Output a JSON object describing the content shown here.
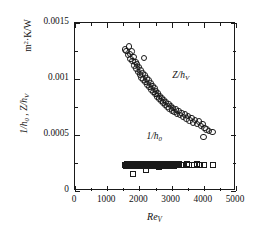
{
  "chart_data": {
    "type": "scatter",
    "title": "",
    "xlabel": "Re_V",
    "ylabel": "1/h0 , Z/hV",
    "yunit": "m2·K/W",
    "xlim": [
      0,
      5000
    ],
    "ylim": [
      0,
      0.0015
    ],
    "grid": false,
    "legend_position": "in-plot-annotations",
    "xticks": [
      0,
      1000,
      2000,
      3000,
      4000,
      5000
    ],
    "xticklabels": [
      "0",
      "1000",
      "2000",
      "3000",
      "4000",
      "5000"
    ],
    "yticks": [
      0,
      0.0005,
      0.001,
      0.0015
    ],
    "yticklabels": [
      "0",
      "0.0005",
      "0.001",
      "0.0015"
    ],
    "xminor_count": 1,
    "yminor_count": 1,
    "annotations": [
      {
        "text": "Z/hV",
        "x": 3050,
        "y": 0.00101
      },
      {
        "text": "1/h0",
        "x": 2250,
        "y": 0.00046
      }
    ],
    "series": [
      {
        "name": "Z/hV",
        "marker": "circle",
        "color": "#1a1a1a",
        "size": 6.4,
        "points": [
          [
            1560,
            0.001265
          ],
          [
            1600,
            0.00125
          ],
          [
            1640,
            0.001215
          ],
          [
            1680,
            0.00129
          ],
          [
            1700,
            0.001225
          ],
          [
            1720,
            0.00118
          ],
          [
            1760,
            0.001245
          ],
          [
            1790,
            0.00116
          ],
          [
            1820,
            0.001195
          ],
          [
            1850,
            0.00112
          ],
          [
            1880,
            0.00115
          ],
          [
            1905,
            0.001095
          ],
          [
            1930,
            0.00113
          ],
          [
            1960,
            0.00106
          ],
          [
            1985,
            0.001105
          ],
          [
            2010,
            0.00104
          ],
          [
            2040,
            0.001075
          ],
          [
            2070,
            0.001015
          ],
          [
            2100,
            0.00105
          ],
          [
            2130,
            0.000995
          ],
          [
            2150,
            0.001185
          ],
          [
            2165,
            0.00103
          ],
          [
            2195,
            0.000975
          ],
          [
            2225,
            0.001005
          ],
          [
            2255,
            0.00095
          ],
          [
            2285,
            0.000985
          ],
          [
            2315,
            0.00093
          ],
          [
            2345,
            0.00096
          ],
          [
            2375,
            0.000905
          ],
          [
            2405,
            0.000935
          ],
          [
            2435,
            0.000885
          ],
          [
            2465,
            0.000915
          ],
          [
            2495,
            0.000865
          ],
          [
            2525,
            0.000895
          ],
          [
            2555,
            0.000845
          ],
          [
            2585,
            0.00087
          ],
          [
            2615,
            0.000825
          ],
          [
            2645,
            0.00085
          ],
          [
            2675,
            0.000805
          ],
          [
            2705,
            0.00083
          ],
          [
            2735,
            0.00079
          ],
          [
            2765,
            0.00081
          ],
          [
            2800,
            0.00077
          ],
          [
            2835,
            0.000795
          ],
          [
            2870,
            0.000755
          ],
          [
            2905,
            0.000775
          ],
          [
            2940,
            0.000735
          ],
          [
            2975,
            0.00076
          ],
          [
            3010,
            0.00072
          ],
          [
            3050,
            0.000742
          ],
          [
            3090,
            0.000705
          ],
          [
            3130,
            0.000726
          ],
          [
            3175,
            0.00069
          ],
          [
            3220,
            0.000712
          ],
          [
            3265,
            0.000676
          ],
          [
            3310,
            0.000698
          ],
          [
            3360,
            0.000662
          ],
          [
            3410,
            0.000684
          ],
          [
            3460,
            0.000648
          ],
          [
            3510,
            0.00067
          ],
          [
            3560,
            0.000628
          ],
          [
            3615,
            0.000652
          ],
          [
            3670,
            0.000612
          ],
          [
            3725,
            0.000636
          ],
          [
            3785,
            0.000598
          ],
          [
            3845,
            0.00062
          ],
          [
            3905,
            0.000578
          ],
          [
            3960,
            0.0006
          ],
          [
            3990,
            0.00048
          ],
          [
            4020,
            0.00056
          ],
          [
            4090,
            0.000548
          ],
          [
            4160,
            0.000538
          ],
          [
            4265,
            0.000528
          ]
        ]
      },
      {
        "name": "1/h0",
        "marker": "square",
        "color": "#1a1a1a",
        "size": 6.0,
        "points": [
          [
            1560,
            0.000232
          ],
          [
            1590,
            0.000226
          ],
          [
            1620,
            0.000238
          ],
          [
            1650,
            0.000222
          ],
          [
            1680,
            0.000234
          ],
          [
            1710,
            0.000228
          ],
          [
            1740,
            0.00024
          ],
          [
            1770,
            0.000224
          ],
          [
            1800,
            0.000236
          ],
          [
            1800,
            0.000152
          ],
          [
            1830,
            0.00023
          ],
          [
            1860,
            0.000242
          ],
          [
            1890,
            0.000226
          ],
          [
            1920,
            0.000238
          ],
          [
            1950,
            0.000232
          ],
          [
            1980,
            0.00022
          ],
          [
            2010,
            0.000236
          ],
          [
            2040,
            0.000228
          ],
          [
            2070,
            0.00024
          ],
          [
            2100,
            0.000224
          ],
          [
            2130,
            0.000234
          ],
          [
            2160,
            0.00023
          ],
          [
            2190,
            0.000242
          ],
          [
            2200,
            0.000185
          ],
          [
            2220,
            0.000226
          ],
          [
            2250,
            0.000238
          ],
          [
            2280,
            0.000232
          ],
          [
            2310,
            0.00022
          ],
          [
            2340,
            0.000236
          ],
          [
            2370,
            0.000228
          ],
          [
            2400,
            0.00024
          ],
          [
            2430,
            0.000226
          ],
          [
            2460,
            0.000234
          ],
          [
            2490,
            0.00023
          ],
          [
            2520,
            0.000242
          ],
          [
            2550,
            0.000224
          ],
          [
            2580,
            0.000236
          ],
          [
            2610,
            0.000218
          ],
          [
            2640,
            0.000232
          ],
          [
            2670,
            0.00024
          ],
          [
            2700,
            0.000226
          ],
          [
            2730,
            0.000234
          ],
          [
            2760,
            0.00023
          ],
          [
            2790,
            0.000222
          ],
          [
            2820,
            0.000238
          ],
          [
            2850,
            0.000228
          ],
          [
            2880,
            0.00024
          ],
          [
            2910,
            0.000232
          ],
          [
            2940,
            0.000224
          ],
          [
            2970,
            0.000236
          ],
          [
            3000,
            0.00023
          ],
          [
            3040,
            0.000242
          ],
          [
            3080,
            0.000226
          ],
          [
            3120,
            0.000234
          ],
          [
            3170,
            0.00023
          ],
          [
            3220,
            0.000238
          ],
          [
            3280,
            0.000228
          ],
          [
            3340,
            0.000236
          ],
          [
            3400,
            0.00023
          ],
          [
            3470,
            0.00024
          ],
          [
            3540,
            0.000232
          ],
          [
            3620,
            0.000236
          ],
          [
            3700,
            0.00023
          ],
          [
            3790,
            0.000238
          ],
          [
            3880,
            0.000232
          ],
          [
            4000,
            0.000236
          ],
          [
            4280,
            0.000234
          ]
        ]
      }
    ]
  }
}
